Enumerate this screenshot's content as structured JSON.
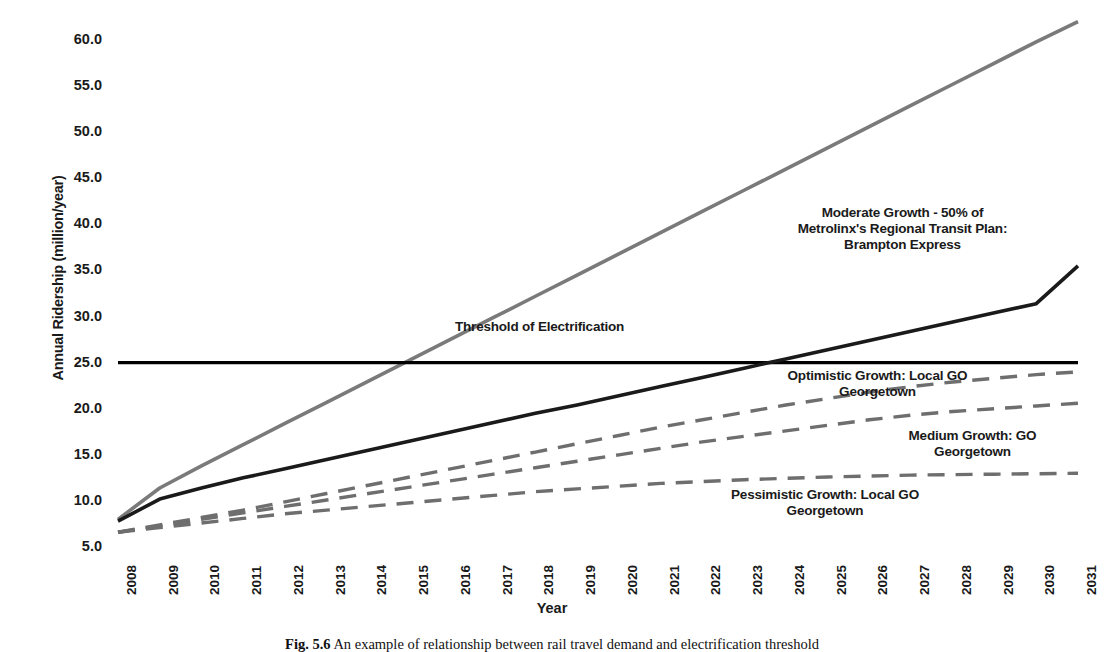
{
  "figure": {
    "caption_prefix": "Fig. 5.6",
    "caption_text": "An example of relationship between rail travel demand and electrification threshold"
  },
  "axes": {
    "y_label": "Annual Ridership (million/year)",
    "x_label": "Year",
    "y_ticks": [
      "60.0",
      "55.0",
      "50.0",
      "45.0",
      "40.0",
      "35.0",
      "30.0",
      "25.0",
      "20.0",
      "15.0",
      "10.0",
      "5.0"
    ],
    "x_ticks": [
      "2008",
      "2009",
      "2010",
      "2011",
      "2012",
      "2013",
      "2014",
      "2015",
      "2016",
      "2017",
      "2018",
      "2019",
      "2020",
      "2021",
      "2022",
      "2023",
      "2024",
      "2025",
      "2026",
      "2027",
      "2028",
      "2029",
      "2030",
      "2031"
    ]
  },
  "annotations": {
    "moderate": "Moderate Growth - 50% of Metrolinx's Regional Transit Plan: Brampton Express",
    "threshold": "Threshold of Electrification",
    "optimistic": "Optimistic Growth: Local GO Georgetown",
    "medium": "Medium Growth: GO Georgetown",
    "pessimistic": "Pessimistic Growth: Local GO Georgetown"
  },
  "colors": {
    "grey_series": "#7a7a7a",
    "black_series": "#1a1a1a",
    "dashed_series": "#6e6e6e",
    "threshold": "#000000"
  },
  "chart_data": {
    "type": "line",
    "title": "",
    "xlabel": "Year",
    "ylabel": "Annual Ridership (million/year)",
    "xlim": [
      2008,
      2031
    ],
    "ylim": [
      5.0,
      62.5
    ],
    "grid": false,
    "legend": "annotations-inline",
    "x": [
      2008,
      2009,
      2010,
      2011,
      2012,
      2013,
      2014,
      2015,
      2016,
      2017,
      2018,
      2019,
      2020,
      2021,
      2022,
      2023,
      2024,
      2025,
      2026,
      2027,
      2028,
      2029,
      2030,
      2031
    ],
    "series": [
      {
        "name": "Moderate Growth - 50% of Metrolinx's Regional Transit Plan: Brampton Express",
        "style": "solid",
        "color": "#7a7a7a",
        "values": [
          8.0,
          11.4,
          13.8,
          16.1,
          18.4,
          20.7,
          23.0,
          25.3,
          27.6,
          29.9,
          32.2,
          34.5,
          36.8,
          39.1,
          41.4,
          43.7,
          46.0,
          48.3,
          50.6,
          52.9,
          55.2,
          57.5,
          59.8,
          62.0
        ]
      },
      {
        "name": "Threshold of Electrification",
        "style": "solid",
        "color": "#000000",
        "values": [
          25.0,
          25.0,
          25.0,
          25.0,
          25.0,
          25.0,
          25.0,
          25.0,
          25.0,
          25.0,
          25.0,
          25.0,
          25.0,
          25.0,
          25.0,
          25.0,
          25.0,
          25.0,
          25.0,
          25.0,
          25.0,
          25.0,
          25.0,
          25.0
        ]
      },
      {
        "name": "Brampton Express trend line",
        "style": "solid",
        "color": "#1a1a1a",
        "values": [
          7.8,
          10.2,
          11.4,
          12.5,
          13.5,
          14.5,
          15.5,
          16.5,
          17.5,
          18.5,
          19.5,
          20.4,
          21.4,
          22.4,
          23.4,
          24.4,
          25.4,
          26.4,
          27.4,
          28.4,
          29.4,
          30.4,
          31.4,
          35.5
        ]
      },
      {
        "name": "Optimistic Growth: Local GO Georgetown",
        "style": "dashed",
        "color": "#6e6e6e",
        "values": [
          6.6,
          7.4,
          8.2,
          9.0,
          9.9,
          10.8,
          11.7,
          12.6,
          13.5,
          14.4,
          15.3,
          16.2,
          17.1,
          18.0,
          18.8,
          19.6,
          20.4,
          21.1,
          21.8,
          22.4,
          22.9,
          23.3,
          23.7,
          24.0
        ]
      },
      {
        "name": "Medium Growth: GO Georgetown",
        "style": "dashed",
        "color": "#6e6e6e",
        "values": [
          6.6,
          7.3,
          8.0,
          8.7,
          9.4,
          10.1,
          10.8,
          11.5,
          12.2,
          12.9,
          13.6,
          14.3,
          15.0,
          15.7,
          16.4,
          17.0,
          17.6,
          18.2,
          18.8,
          19.3,
          19.7,
          20.0,
          20.3,
          20.6
        ]
      },
      {
        "name": "Pessimistic Growth: Local GO Georgetown",
        "style": "dashed",
        "color": "#6e6e6e",
        "values": [
          6.6,
          7.1,
          7.6,
          8.1,
          8.6,
          9.0,
          9.4,
          9.8,
          10.2,
          10.6,
          11.0,
          11.3,
          11.6,
          11.9,
          12.1,
          12.3,
          12.45,
          12.6,
          12.7,
          12.8,
          12.85,
          12.9,
          12.95,
          13.0
        ]
      }
    ]
  }
}
